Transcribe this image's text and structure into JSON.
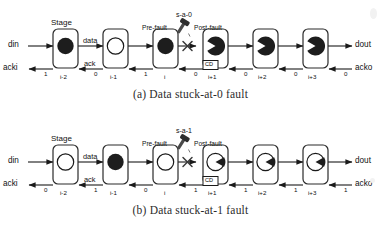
{
  "figures": [
    {
      "id": "a",
      "caption": "(a) Data stuck-at-0 fault",
      "io": {
        "din": "din",
        "acki": "acki",
        "dout": "dout",
        "acko": "acko"
      },
      "annotations": {
        "stage": "Stage",
        "data": "data",
        "ack": "ack",
        "pre_fault": "Pre-fault",
        "post_fault": "Post-fault",
        "fault_type": "s-a-0",
        "cd": "CD"
      },
      "stages": [
        {
          "index_label": "i-2",
          "token": "full",
          "ack_value": "1"
        },
        {
          "index_label": "i-1",
          "token": "empty",
          "ack_value": "0"
        },
        {
          "index_label": "i",
          "token": "full",
          "ack_value": "1"
        },
        {
          "index_label": "i+1",
          "token": "pac-left-white-wedge",
          "ack_value": "0"
        },
        {
          "index_label": "i+2",
          "token": "pac-left-white-wedge",
          "ack_value": "0"
        },
        {
          "index_label": "i+3",
          "token": "pac-left-white-wedge",
          "ack_value": "0"
        }
      ],
      "acko_value": "0"
    },
    {
      "id": "b",
      "caption": "(b) Data stuck-at-1 fault",
      "io": {
        "din": "din",
        "acki": "acki",
        "dout": "dout",
        "acko": "acko"
      },
      "annotations": {
        "stage": "Stage",
        "data": "data",
        "ack": "ack",
        "pre_fault": "Pre-fault",
        "post_fault": "Post-fault",
        "fault_type": "s-a-1",
        "cd": "CD"
      },
      "stages": [
        {
          "index_label": "i-2",
          "token": "empty",
          "ack_value": "0"
        },
        {
          "index_label": "i-1",
          "token": "full",
          "ack_value": "1"
        },
        {
          "index_label": "i",
          "token": "empty",
          "ack_value": "0"
        },
        {
          "index_label": "i+1",
          "token": "pac-right-black-wedge",
          "ack_value": "1"
        },
        {
          "index_label": "i+2",
          "token": "pac-right-black-wedge",
          "ack_value": "1"
        },
        {
          "index_label": "i+3",
          "token": "pac-right-black-wedge",
          "ack_value": "1"
        }
      ],
      "acko_value": "1"
    }
  ],
  "colors": {
    "line": "#1a1a1a",
    "token_fill": "#1d1d1d",
    "box_stroke": "#2b2b2b",
    "fault_mark": "#3a3a3a"
  }
}
